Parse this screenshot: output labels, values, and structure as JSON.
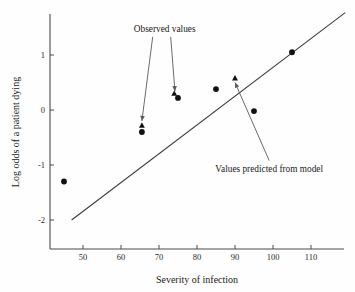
{
  "chart_data": {
    "type": "scatter",
    "title": "",
    "xlabel": "Severity of infection",
    "ylabel": "Log odds of a patient dying",
    "xlim": [
      40,
      118
    ],
    "ylim": [
      -2.6,
      1.9
    ],
    "xticks": [
      50,
      60,
      70,
      80,
      90,
      100,
      110
    ],
    "xticklabels": [
      "50",
      "60",
      "70",
      "80",
      "90",
      "100",
      "110"
    ],
    "yticks": [
      1,
      0,
      -1,
      -2
    ],
    "yticklabels": [
      "1",
      "0",
      "-1",
      "-2"
    ],
    "grid": false,
    "legend": "none",
    "series": [
      {
        "name": "Observed values",
        "marker": "circle",
        "points": [
          {
            "x": 45,
            "y": -1.3
          },
          {
            "x": 65.5,
            "y": -0.4
          },
          {
            "x": 75,
            "y": 0.22
          },
          {
            "x": 85,
            "y": 0.38
          },
          {
            "x": 95,
            "y": -0.02
          },
          {
            "x": 105,
            "y": 1.05
          }
        ]
      },
      {
        "name": "Values predicted from model",
        "marker": "triangle",
        "points": [
          {
            "x": 65.5,
            "y": -0.28
          },
          {
            "x": 74,
            "y": 0.3
          },
          {
            "x": 90,
            "y": 0.58
          }
        ]
      }
    ],
    "fit_line": {
      "name": "model fit line",
      "x_start": 47,
      "y_start": -2.0,
      "x_end": 119,
      "y_end": 1.77
    },
    "annotations": [
      {
        "text": "Observed values",
        "x": 71.5,
        "y": 1.42,
        "arrows": [
          {
            "to_x": 65.5,
            "to_y": -0.2
          },
          {
            "to_x": 74.2,
            "to_y": 0.34
          }
        ]
      },
      {
        "text": "Values predicted from model",
        "x": 99,
        "y": -1.12,
        "arrows": [
          {
            "to_x": 90,
            "to_y": 0.5
          }
        ]
      }
    ]
  },
  "colors": {
    "marker": "#111111",
    "axis": "#4a4a4a",
    "line": "#3a3a3a",
    "leader": "#5a5a5a",
    "background": "#fefefe"
  }
}
